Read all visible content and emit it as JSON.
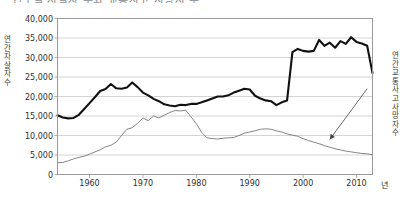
{
  "title_clipped": "연도별 자살자 수와 교통사고 사망자 수",
  "axes": {
    "y_left_title": "연간 자살자 수",
    "y_right_title": "연간 교통사고 사망자 수",
    "x_unit": "년"
  },
  "chart_data": {
    "type": "line",
    "title": "연도별 자살자 수와 교통사고 사망자 수",
    "xlabel": "년",
    "ylabel": "연간 자살자 수",
    "y2label": "연간 교통사고 사망자 수",
    "xlim": [
      1954,
      2013
    ],
    "ylim": [
      0,
      40000
    ],
    "grid": true,
    "legend": "none",
    "y_ticks": [
      0,
      5000,
      10000,
      15000,
      20000,
      25000,
      30000,
      35000,
      40000
    ],
    "y_tick_labels": [
      "0",
      "5,000",
      "10,000",
      "15,000",
      "20,000",
      "25,000",
      "30,000",
      "35,000",
      "40,000"
    ],
    "x_ticks": [
      1960,
      1970,
      1980,
      1990,
      2000,
      2010
    ],
    "x_tick_labels": [
      "1960",
      "1970",
      "1980",
      "1990",
      "2000",
      "2010"
    ],
    "annotations": [
      {
        "text": "연간 교통사고 사망자 수",
        "type": "arrow",
        "from": [
          2012,
          22000
        ],
        "to": [
          2005,
          9000
        ]
      }
    ],
    "series": [
      {
        "name": "연간 자살자 수",
        "style": "thick-black",
        "color": "#111111",
        "axis": "left",
        "x": [
          1954,
          1955,
          1956,
          1957,
          1958,
          1959,
          1960,
          1961,
          1962,
          1963,
          1964,
          1965,
          1966,
          1967,
          1968,
          1969,
          1970,
          1971,
          1972,
          1973,
          1974,
          1975,
          1976,
          1977,
          1978,
          1979,
          1980,
          1981,
          1982,
          1983,
          1984,
          1985,
          1986,
          1987,
          1988,
          1989,
          1990,
          1991,
          1992,
          1993,
          1994,
          1995,
          1996,
          1997,
          1998,
          1999,
          2000,
          2001,
          2002,
          2003,
          2004,
          2005,
          2006,
          2007,
          2008,
          2009,
          2010,
          2011,
          2012,
          2013
        ],
        "values": [
          15200,
          14600,
          14400,
          14500,
          15300,
          16800,
          18300,
          19800,
          21400,
          21900,
          23200,
          22100,
          22000,
          22300,
          23600,
          22400,
          21000,
          20300,
          19400,
          18800,
          18000,
          17700,
          17500,
          17900,
          17800,
          18100,
          18100,
          18500,
          19000,
          19500,
          20000,
          20000,
          20300,
          21000,
          21500,
          22000,
          21800,
          20200,
          19500,
          19000,
          18800,
          17800,
          18500,
          19000,
          31400,
          32200,
          31700,
          31500,
          31700,
          34500,
          33000,
          33800,
          32500,
          34200,
          33500,
          35200,
          34000,
          33600,
          33000,
          26000
        ]
      },
      {
        "name": "연간 교통사고 사망자 수",
        "style": "thin-gray",
        "color": "#6f6f6f",
        "axis": "right",
        "x": [
          1954,
          1955,
          1956,
          1957,
          1958,
          1959,
          1960,
          1961,
          1962,
          1963,
          1964,
          1965,
          1966,
          1967,
          1968,
          1969,
          1970,
          1971,
          1972,
          1973,
          1974,
          1975,
          1976,
          1977,
          1978,
          1979,
          1980,
          1981,
          1982,
          1983,
          1984,
          1985,
          1986,
          1987,
          1988,
          1989,
          1990,
          1991,
          1992,
          1993,
          1994,
          1995,
          1996,
          1997,
          1998,
          1999,
          2000,
          2001,
          2002,
          2003,
          2004,
          2005,
          2006,
          2007,
          2008,
          2009,
          2010,
          2011,
          2012,
          2013
        ],
        "values": [
          3000,
          3100,
          3500,
          4000,
          4400,
          4700,
          5200,
          5800,
          6300,
          7100,
          7500,
          8300,
          10000,
          11600,
          12000,
          13100,
          14500,
          13800,
          15000,
          14500,
          15200,
          15900,
          16400,
          16300,
          16500,
          14800,
          13000,
          10800,
          9400,
          9200,
          9100,
          9300,
          9400,
          9500,
          10000,
          10600,
          10900,
          11200,
          11600,
          11700,
          11600,
          11200,
          10900,
          10400,
          10100,
          9800,
          9200,
          8700,
          8300,
          7900,
          7400,
          7000,
          6600,
          6300,
          6000,
          5800,
          5600,
          5400,
          5300,
          5100
        ]
      }
    ]
  }
}
